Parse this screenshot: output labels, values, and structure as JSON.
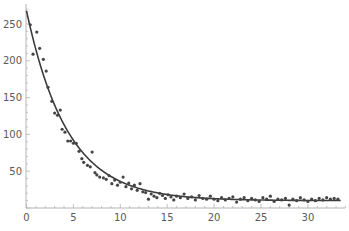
{
  "chart_data": {
    "type": "scatter",
    "title": "",
    "xlabel": "",
    "ylabel": "",
    "xlim": [
      0,
      34
    ],
    "ylim": [
      0,
      270
    ],
    "grid": false,
    "legend": null,
    "x_ticks": [
      0,
      5,
      10,
      15,
      20,
      25,
      30
    ],
    "y_ticks": [
      50,
      100,
      150,
      200,
      250
    ],
    "colors": {
      "points": "#454545",
      "curve": "#3c3c3c",
      "axis": "#b4b4b4",
      "tick_label": "#5a5a5a"
    },
    "series": [
      {
        "name": "data",
        "kind": "scatter",
        "points": [
          [
            0.4,
            249
          ],
          [
            0.7,
            209
          ],
          [
            1.1,
            239
          ],
          [
            1.4,
            217
          ],
          [
            1.8,
            202
          ],
          [
            2.1,
            186
          ],
          [
            2.3,
            164
          ],
          [
            2.7,
            145
          ],
          [
            3.0,
            129
          ],
          [
            3.3,
            126
          ],
          [
            3.6,
            133
          ],
          [
            3.8,
            107
          ],
          [
            4.1,
            103
          ],
          [
            4.4,
            91
          ],
          [
            4.7,
            91
          ],
          [
            5.0,
            88
          ],
          [
            5.3,
            88
          ],
          [
            5.6,
            77
          ],
          [
            5.9,
            67
          ],
          [
            6.1,
            62
          ],
          [
            6.5,
            58
          ],
          [
            6.8,
            56
          ],
          [
            7.0,
            76
          ],
          [
            7.3,
            48
          ],
          [
            7.5,
            45
          ],
          [
            7.8,
            42
          ],
          [
            8.2,
            41
          ],
          [
            8.5,
            39
          ],
          [
            8.8,
            44
          ],
          [
            9.1,
            33
          ],
          [
            9.4,
            38
          ],
          [
            9.7,
            31
          ],
          [
            10.0,
            35
          ],
          [
            10.3,
            42
          ],
          [
            10.6,
            29
          ],
          [
            10.9,
            34
          ],
          [
            11.2,
            26
          ],
          [
            11.5,
            31
          ],
          [
            11.8,
            24
          ],
          [
            12.1,
            33
          ],
          [
            12.4,
            22
          ],
          [
            12.7,
            21
          ],
          [
            13.0,
            12
          ],
          [
            13.3,
            19
          ],
          [
            13.6,
            16
          ],
          [
            13.9,
            14
          ],
          [
            14.2,
            20
          ],
          [
            14.5,
            17
          ],
          [
            14.8,
            13
          ],
          [
            15.1,
            18
          ],
          [
            15.4,
            15
          ],
          [
            15.7,
            11
          ],
          [
            16.0,
            16
          ],
          [
            16.4,
            14
          ],
          [
            16.8,
            19
          ],
          [
            17.2,
            13
          ],
          [
            17.6,
            15
          ],
          [
            18.0,
            11
          ],
          [
            18.4,
            17
          ],
          [
            18.8,
            13
          ],
          [
            19.2,
            12
          ],
          [
            19.6,
            16
          ],
          [
            20.0,
            12
          ],
          [
            20.4,
            10
          ],
          [
            20.8,
            14
          ],
          [
            21.2,
            11
          ],
          [
            21.6,
            13
          ],
          [
            22.0,
            15
          ],
          [
            22.4,
            8
          ],
          [
            22.8,
            12
          ],
          [
            23.2,
            14
          ],
          [
            23.6,
            10
          ],
          [
            24.0,
            13
          ],
          [
            24.4,
            11
          ],
          [
            24.8,
            9
          ],
          [
            25.2,
            14
          ],
          [
            25.6,
            12
          ],
          [
            26.0,
            16
          ],
          [
            26.4,
            9
          ],
          [
            26.8,
            12
          ],
          [
            27.2,
            11
          ],
          [
            27.6,
            13
          ],
          [
            28.0,
            4
          ],
          [
            28.4,
            12
          ],
          [
            28.8,
            10
          ],
          [
            29.2,
            14
          ],
          [
            29.6,
            11
          ],
          [
            30.0,
            9
          ],
          [
            30.4,
            12
          ],
          [
            30.8,
            10
          ],
          [
            31.2,
            13
          ],
          [
            31.6,
            11
          ],
          [
            32.0,
            14
          ],
          [
            32.4,
            12
          ],
          [
            32.8,
            13
          ],
          [
            33.2,
            12
          ]
        ]
      },
      {
        "name": "fit",
        "kind": "line",
        "formula": "y = 10 + 258*exp(-0.229*x)",
        "x_range": [
          0,
          33.5
        ]
      }
    ]
  }
}
